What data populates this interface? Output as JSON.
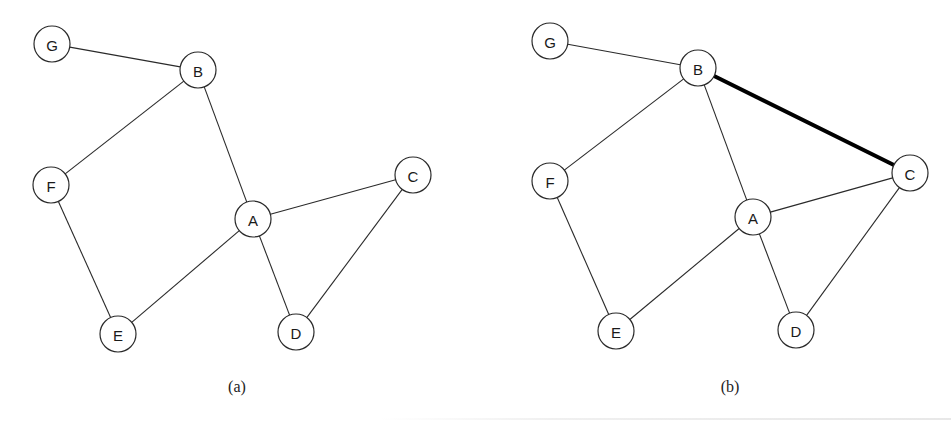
{
  "figure": {
    "node_radius": 18,
    "colors": {
      "edge": "#2a2a2a",
      "highlight_edge": "#000000",
      "node_fill": "#ffffff",
      "node_stroke": "#2a2a2a"
    },
    "panels": [
      {
        "id": "a",
        "caption": "(a)",
        "caption_pos": {
          "x": 237,
          "y": 378
        },
        "nodes": [
          {
            "label": "G",
            "x": 52,
            "y": 44
          },
          {
            "label": "B",
            "x": 198,
            "y": 70
          },
          {
            "label": "F",
            "x": 51,
            "y": 185
          },
          {
            "label": "A",
            "x": 253,
            "y": 219
          },
          {
            "label": "C",
            "x": 413,
            "y": 175
          },
          {
            "label": "E",
            "x": 118,
            "y": 334
          },
          {
            "label": "D",
            "x": 296,
            "y": 332
          }
        ],
        "edges": [
          {
            "from": "G",
            "to": "B",
            "highlight": false
          },
          {
            "from": "B",
            "to": "F",
            "highlight": false
          },
          {
            "from": "B",
            "to": "A",
            "highlight": false
          },
          {
            "from": "F",
            "to": "E",
            "highlight": false
          },
          {
            "from": "E",
            "to": "A",
            "highlight": false
          },
          {
            "from": "A",
            "to": "C",
            "highlight": false
          },
          {
            "from": "A",
            "to": "D",
            "highlight": false
          },
          {
            "from": "C",
            "to": "D",
            "highlight": false
          }
        ]
      },
      {
        "id": "b",
        "caption": "(b)",
        "caption_pos": {
          "x": 730,
          "y": 378
        },
        "nodes": [
          {
            "label": "G",
            "x": 550,
            "y": 41
          },
          {
            "label": "B",
            "x": 698,
            "y": 68
          },
          {
            "label": "F",
            "x": 550,
            "y": 181
          },
          {
            "label": "A",
            "x": 753,
            "y": 217
          },
          {
            "label": "C",
            "x": 910,
            "y": 173
          },
          {
            "label": "E",
            "x": 616,
            "y": 331
          },
          {
            "label": "D",
            "x": 796,
            "y": 330
          }
        ],
        "edges": [
          {
            "from": "G",
            "to": "B",
            "highlight": false
          },
          {
            "from": "B",
            "to": "F",
            "highlight": false
          },
          {
            "from": "B",
            "to": "A",
            "highlight": false
          },
          {
            "from": "B",
            "to": "C",
            "highlight": true
          },
          {
            "from": "F",
            "to": "E",
            "highlight": false
          },
          {
            "from": "E",
            "to": "A",
            "highlight": false
          },
          {
            "from": "A",
            "to": "C",
            "highlight": false
          },
          {
            "from": "A",
            "to": "D",
            "highlight": false
          },
          {
            "from": "C",
            "to": "D",
            "highlight": false
          }
        ]
      }
    ]
  }
}
